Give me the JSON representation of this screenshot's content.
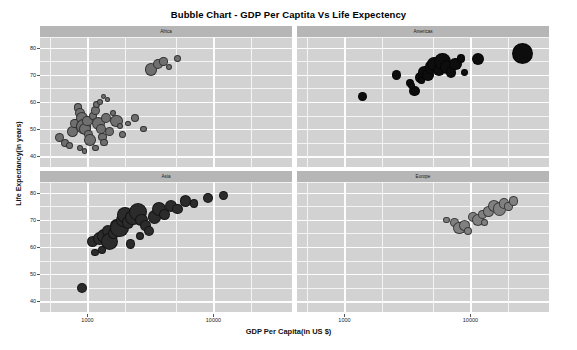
{
  "chart_data": {
    "type": "scatter",
    "title": "Bubble Chart - GDP Per Captita Vs Life Expectency",
    "xlabel": "GDP Per Capita(in US $)",
    "ylabel": "Life Expectancy(in years)",
    "xscale": "log",
    "xticks": [
      "1000",
      "10000"
    ],
    "yticks": [
      "80",
      "70",
      "60",
      "50",
      "40"
    ],
    "ylim": [
      36,
      84
    ],
    "grid": true,
    "legend": "none",
    "facets": [
      {
        "label": "Africa",
        "color": "#6f6f6f",
        "row": 0,
        "col": 0,
        "points": [
          {
            "x": 600,
            "y": 47,
            "r": 4.5
          },
          {
            "x": 660,
            "y": 45,
            "r": 4.0
          },
          {
            "x": 720,
            "y": 44,
            "r": 3.6
          },
          {
            "x": 760,
            "y": 49,
            "r": 5.5
          },
          {
            "x": 800,
            "y": 52,
            "r": 4.8
          },
          {
            "x": 840,
            "y": 58,
            "r": 4.2
          },
          {
            "x": 880,
            "y": 56,
            "r": 5.0
          },
          {
            "x": 900,
            "y": 54,
            "r": 6.2
          },
          {
            "x": 930,
            "y": 51,
            "r": 7.5
          },
          {
            "x": 960,
            "y": 50,
            "r": 6.0
          },
          {
            "x": 1000,
            "y": 53,
            "r": 5.2
          },
          {
            "x": 1020,
            "y": 48,
            "r": 4.4
          },
          {
            "x": 1050,
            "y": 46,
            "r": 5.8
          },
          {
            "x": 1100,
            "y": 55,
            "r": 4.0
          },
          {
            "x": 1150,
            "y": 57,
            "r": 4.6
          },
          {
            "x": 1180,
            "y": 59,
            "r": 3.4
          },
          {
            "x": 1220,
            "y": 52,
            "r": 6.8
          },
          {
            "x": 1280,
            "y": 50,
            "r": 5.4
          },
          {
            "x": 1320,
            "y": 47,
            "r": 4.2
          },
          {
            "x": 1360,
            "y": 45,
            "r": 3.8
          },
          {
            "x": 1400,
            "y": 54,
            "r": 5.0
          },
          {
            "x": 1450,
            "y": 61,
            "r": 2.6
          },
          {
            "x": 1500,
            "y": 49,
            "r": 4.6
          },
          {
            "x": 1600,
            "y": 56,
            "r": 3.2
          },
          {
            "x": 1700,
            "y": 53,
            "r": 6.4
          },
          {
            "x": 1800,
            "y": 51,
            "r": 3.0
          },
          {
            "x": 1900,
            "y": 48,
            "r": 3.6
          },
          {
            "x": 2100,
            "y": 52,
            "r": 2.8
          },
          {
            "x": 2400,
            "y": 54,
            "r": 4.0
          },
          {
            "x": 2800,
            "y": 50,
            "r": 3.4
          },
          {
            "x": 3200,
            "y": 72,
            "r": 6.2
          },
          {
            "x": 3600,
            "y": 74,
            "r": 5.0
          },
          {
            "x": 4000,
            "y": 75,
            "r": 4.2
          },
          {
            "x": 4400,
            "y": 73,
            "r": 3.0
          },
          {
            "x": 5200,
            "y": 76,
            "r": 3.6
          },
          {
            "x": 1250,
            "y": 60,
            "r": 3.0
          },
          {
            "x": 1340,
            "y": 62,
            "r": 2.4
          },
          {
            "x": 870,
            "y": 43,
            "r": 3.2
          },
          {
            "x": 950,
            "y": 42,
            "r": 2.8
          },
          {
            "x": 1150,
            "y": 43,
            "r": 3.4
          }
        ]
      },
      {
        "label": "Americas",
        "color": "#0d0d0d",
        "row": 0,
        "col": 1,
        "points": [
          {
            "x": 1400,
            "y": 62,
            "r": 4.4
          },
          {
            "x": 2600,
            "y": 70,
            "r": 4.6
          },
          {
            "x": 3300,
            "y": 67,
            "r": 4.2
          },
          {
            "x": 3600,
            "y": 64,
            "r": 5.2
          },
          {
            "x": 4000,
            "y": 69,
            "r": 5.6
          },
          {
            "x": 4300,
            "y": 71,
            "r": 6.4
          },
          {
            "x": 4600,
            "y": 70,
            "r": 5.8
          },
          {
            "x": 4900,
            "y": 73,
            "r": 6.8
          },
          {
            "x": 5200,
            "y": 74,
            "r": 7.4
          },
          {
            "x": 5600,
            "y": 72,
            "r": 6.0
          },
          {
            "x": 6000,
            "y": 75,
            "r": 8.4
          },
          {
            "x": 6500,
            "y": 73,
            "r": 7.0
          },
          {
            "x": 7000,
            "y": 71,
            "r": 5.4
          },
          {
            "x": 7600,
            "y": 74,
            "r": 6.2
          },
          {
            "x": 8400,
            "y": 76,
            "r": 4.2
          },
          {
            "x": 9000,
            "y": 71,
            "r": 3.4
          },
          {
            "x": 11500,
            "y": 76,
            "r": 6.0
          },
          {
            "x": 26000,
            "y": 78,
            "r": 10.5
          },
          {
            "x": 3400,
            "y": 66,
            "r": 3.6
          },
          {
            "x": 4100,
            "y": 68,
            "r": 3.2
          }
        ]
      },
      {
        "label": "Asia",
        "color": "#2b2b2b",
        "row": 1,
        "col": 0,
        "points": [
          {
            "x": 900,
            "y": 45,
            "r": 5.0
          },
          {
            "x": 1100,
            "y": 62,
            "r": 5.8
          },
          {
            "x": 1250,
            "y": 63,
            "r": 6.6
          },
          {
            "x": 1350,
            "y": 64,
            "r": 7.2
          },
          {
            "x": 1450,
            "y": 66,
            "r": 6.0
          },
          {
            "x": 1500,
            "y": 62,
            "r": 8.6
          },
          {
            "x": 1600,
            "y": 65,
            "r": 5.4
          },
          {
            "x": 1700,
            "y": 68,
            "r": 6.8
          },
          {
            "x": 1800,
            "y": 67,
            "r": 9.4
          },
          {
            "x": 1900,
            "y": 70,
            "r": 7.0
          },
          {
            "x": 2000,
            "y": 72,
            "r": 8.0
          },
          {
            "x": 2100,
            "y": 69,
            "r": 6.2
          },
          {
            "x": 2300,
            "y": 71,
            "r": 7.6
          },
          {
            "x": 2500,
            "y": 73,
            "r": 9.0
          },
          {
            "x": 2700,
            "y": 70,
            "r": 6.4
          },
          {
            "x": 2900,
            "y": 68,
            "r": 5.6
          },
          {
            "x": 3100,
            "y": 66,
            "r": 5.0
          },
          {
            "x": 3400,
            "y": 71,
            "r": 6.8
          },
          {
            "x": 3700,
            "y": 74,
            "r": 7.2
          },
          {
            "x": 4100,
            "y": 72,
            "r": 5.8
          },
          {
            "x": 4600,
            "y": 75,
            "r": 6.0
          },
          {
            "x": 5200,
            "y": 74,
            "r": 5.2
          },
          {
            "x": 6000,
            "y": 77,
            "r": 5.6
          },
          {
            "x": 7000,
            "y": 76,
            "r": 4.4
          },
          {
            "x": 9000,
            "y": 78,
            "r": 5.0
          },
          {
            "x": 12000,
            "y": 79,
            "r": 4.6
          },
          {
            "x": 2200,
            "y": 61,
            "r": 4.8
          },
          {
            "x": 1300,
            "y": 59,
            "r": 4.2
          },
          {
            "x": 1150,
            "y": 58,
            "r": 3.8
          },
          {
            "x": 2600,
            "y": 64,
            "r": 4.0
          }
        ]
      },
      {
        "label": "Europe",
        "color": "#808080",
        "row": 1,
        "col": 1,
        "points": [
          {
            "x": 6500,
            "y": 70,
            "r": 3.4
          },
          {
            "x": 7500,
            "y": 69,
            "r": 4.4
          },
          {
            "x": 8200,
            "y": 67,
            "r": 6.4
          },
          {
            "x": 9000,
            "y": 68,
            "r": 5.6
          },
          {
            "x": 10500,
            "y": 71,
            "r": 5.0
          },
          {
            "x": 11500,
            "y": 70,
            "r": 6.2
          },
          {
            "x": 12500,
            "y": 72,
            "r": 4.6
          },
          {
            "x": 14000,
            "y": 73,
            "r": 5.4
          },
          {
            "x": 15500,
            "y": 75,
            "r": 6.0
          },
          {
            "x": 17000,
            "y": 74,
            "r": 6.8
          },
          {
            "x": 18500,
            "y": 76,
            "r": 5.2
          },
          {
            "x": 20000,
            "y": 75,
            "r": 4.2
          },
          {
            "x": 22000,
            "y": 77,
            "r": 4.8
          },
          {
            "x": 9500,
            "y": 66,
            "r": 4.0
          },
          {
            "x": 13000,
            "y": 69,
            "r": 3.6
          }
        ]
      }
    ]
  }
}
